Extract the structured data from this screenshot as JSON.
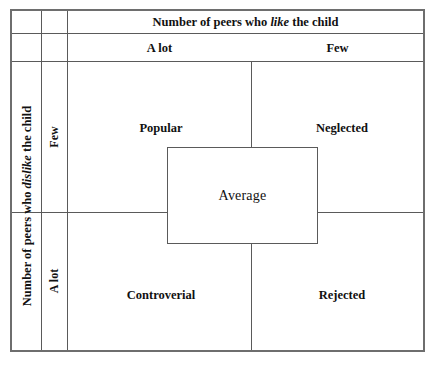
{
  "figure": {
    "title_top": {
      "prefix": "Number of peers who ",
      "emphasis": "like",
      "suffix": " the child"
    },
    "title_left": {
      "prefix": "Number of peers who ",
      "emphasis": "dislike",
      "suffix": " the child"
    },
    "column_headers": [
      {
        "label": "A lot"
      },
      {
        "label": "Few"
      }
    ],
    "row_headers": [
      {
        "label": "Few"
      },
      {
        "label": "A lot"
      }
    ],
    "quadrants": [
      {
        "label": "Popular"
      },
      {
        "label": "Neglected"
      },
      {
        "label": "Controverial"
      },
      {
        "label": "Rejected"
      }
    ],
    "center": {
      "label": "Average"
    },
    "colors": {
      "frame": "#6e6e6e",
      "rule": "#5a5a5a",
      "text": "#111111",
      "background": "#ffffff"
    }
  },
  "chart_data": {
    "type": "table",
    "xlabel": "Number of peers who like the child",
    "ylabel": "Number of peers who dislike the child",
    "x_categories": [
      "A lot",
      "Few"
    ],
    "y_categories": [
      "Few",
      "A lot"
    ],
    "cells": [
      {
        "row": "Few",
        "column": "A lot",
        "value": "Popular"
      },
      {
        "row": "Few",
        "column": "Few",
        "value": "Neglected"
      },
      {
        "row": "A lot",
        "column": "A lot",
        "value": "Controverial"
      },
      {
        "row": "A lot",
        "column": "Few",
        "value": "Rejected"
      }
    ],
    "center_overlay": "Average",
    "grid": true,
    "legend": "none"
  }
}
